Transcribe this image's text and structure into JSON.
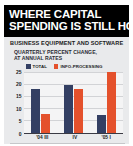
{
  "title": {
    "line1": "WHERE CAPITAL",
    "line2": "SPENDING IS STILL HOT"
  },
  "subtitle": {
    "main": "BUSINESS EQUIPMENT AND SOFTWARE",
    "line1": "QUARTERLY PERCENT CHANGE,",
    "line2": "AT ANNUAL RATES"
  },
  "colors": {
    "total": "#333f63",
    "info_processing": "#e4512c",
    "banner_bg": "#000000",
    "banner_text": "#ffffff",
    "card_bg": "#e9eaec",
    "panel_bg": "#f4f4f5",
    "axis": "#3a3a44",
    "grid": "#d2d3d6"
  },
  "source": "Data: Bureau of Economic Analysis, Global Insight Inc.",
  "chart_data": {
    "type": "bar",
    "title": "WHERE CAPITAL SPENDING IS STILL HOT",
    "subtitle": "BUSINESS EQUIPMENT AND SOFTWARE — QUARTERLY PERCENT CHANGE, AT ANNUAL RATES",
    "xlabel": "",
    "ylabel": "",
    "ylim": [
      0,
      25
    ],
    "yticks": [
      0,
      5,
      10,
      15,
      20,
      25
    ],
    "ytick_labels": [
      "0",
      "5",
      "10",
      "15",
      "20",
      "25"
    ],
    "grid": true,
    "legend_position": "top-left",
    "categories": [
      "'04 III",
      "IV",
      "'05 I"
    ],
    "series": [
      {
        "name": "TOTAL",
        "color": "#333f63",
        "values": [
          18.0,
          19.5,
          7.0
        ]
      },
      {
        "name": "INFO-PROCESSING",
        "color": "#e4512c",
        "values": [
          7.5,
          18.0,
          25.0
        ]
      }
    ]
  }
}
